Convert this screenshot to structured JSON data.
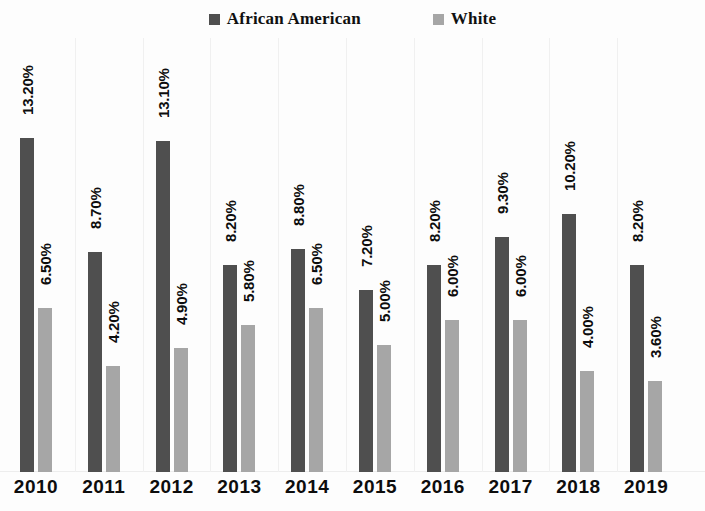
{
  "chart_data": {
    "type": "bar",
    "title": "",
    "subtitle": "",
    "xlabel": "",
    "ylabel": "",
    "grid": false,
    "legend_position": "top-center",
    "value_format": "percent",
    "ylim": [
      0,
      13.2
    ],
    "axis_visible": {
      "x": true,
      "y": false
    },
    "categories": [
      "2010",
      "2011",
      "2012",
      "2013",
      "2014",
      "2015",
      "2016",
      "2017",
      "2018",
      "2019"
    ],
    "series": [
      {
        "name": "African American",
        "color": "#4f4f4f",
        "values": [
          13.2,
          8.7,
          13.1,
          8.2,
          8.8,
          7.2,
          8.2,
          9.3,
          10.2,
          8.2
        ],
        "labels": [
          "13.20%",
          "8.70%",
          "13.10%",
          "8.20%",
          "8.80%",
          "7.20%",
          "8.20%",
          "9.30%",
          "10.20%",
          "8.20%"
        ]
      },
      {
        "name": "White",
        "color": "#a6a6a6",
        "values": [
          6.5,
          4.2,
          4.9,
          5.8,
          6.5,
          5.0,
          6.0,
          6.0,
          4.0,
          3.6
        ],
        "labels": [
          "6.50%",
          "4.20%",
          "4.90%",
          "5.80%",
          "6.50%",
          "5.00%",
          "6.00%",
          "6.00%",
          "4.00%",
          "3.60%"
        ]
      }
    ]
  },
  "legend": {
    "items": [
      {
        "label": "African American",
        "color": "#4f4f4f",
        "swatch_name": "legend-swatch-african-american"
      },
      {
        "label": "White",
        "color": "#a6a6a6",
        "swatch_name": "legend-swatch-white"
      }
    ]
  }
}
